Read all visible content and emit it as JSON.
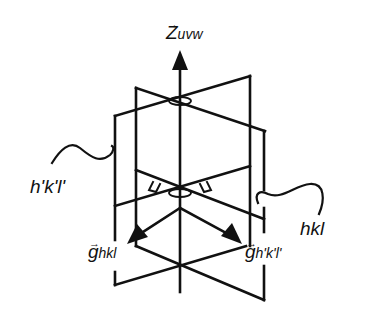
{
  "figure": {
    "type": "crystallographic zone axis diagram",
    "stroke_color": "#111111",
    "background": "#ffffff"
  },
  "labels": {
    "zone_axis": {
      "symbol": "Z",
      "subscript": "uvw",
      "vector_arrow": "→"
    },
    "plane_left": {
      "text": "h'k'l'"
    },
    "plane_right": {
      "text": "hkl"
    },
    "normal_left": {
      "symbol": "g",
      "subscript": "hkl",
      "vector_arrow": "→"
    },
    "normal_right": {
      "symbol": "g",
      "subscript": "h'k'l'",
      "vector_arrow": "→"
    }
  }
}
